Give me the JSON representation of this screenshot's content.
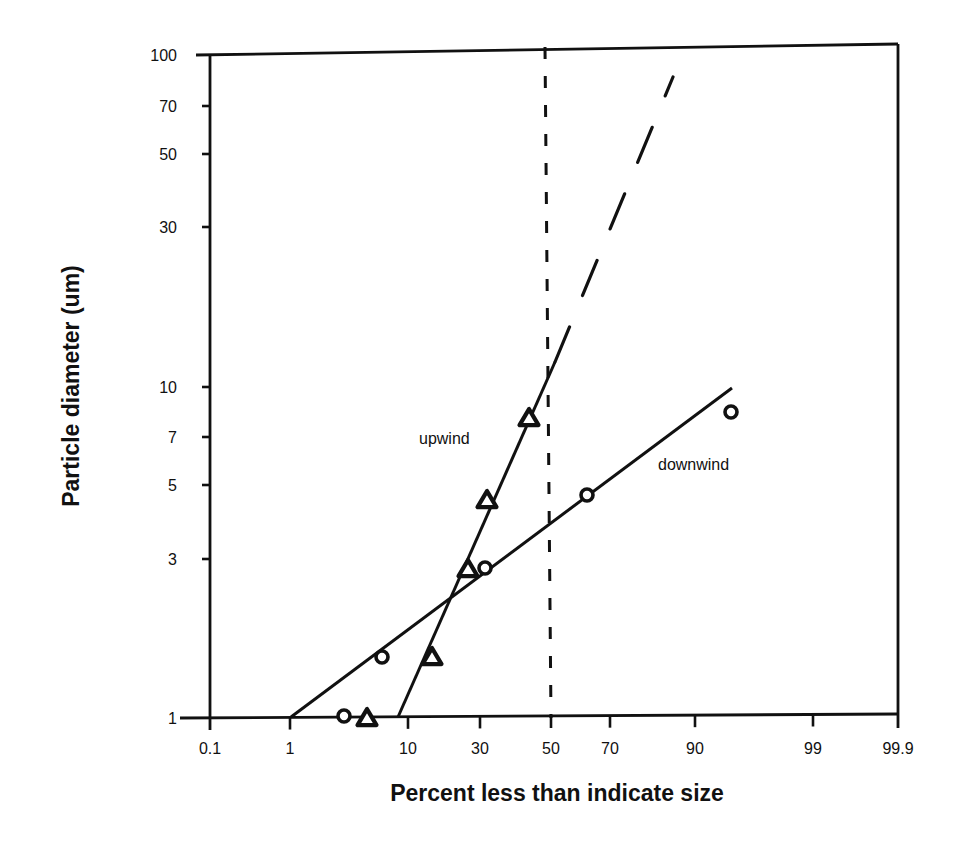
{
  "chart_data": {
    "type": "scatter",
    "title": "",
    "xlabel": "Percent less than indicate size",
    "ylabel": "Particle diameter (um)",
    "x_scale": "probability",
    "y_scale": "log",
    "xlim": [
      0.1,
      99.9
    ],
    "ylim": [
      1,
      100
    ],
    "grid": false,
    "legend": "none (inline annotations)",
    "x_ticks": [
      {
        "label": "0.1",
        "px": 210
      },
      {
        "label": "1",
        "px": 290
      },
      {
        "label": "10",
        "px": 408
      },
      {
        "label": "30",
        "px": 480
      },
      {
        "label": "50",
        "px": 551
      },
      {
        "label": "70",
        "px": 610
      },
      {
        "label": "90",
        "px": 695
      },
      {
        "label": "99",
        "px": 813
      },
      {
        "label": "99.9",
        "px": 898
      }
    ],
    "y_ticks": [
      {
        "label": "100",
        "py": 55
      },
      {
        "label": "70",
        "py": 106
      },
      {
        "label": "50",
        "py": 154
      },
      {
        "label": "30",
        "py": 227
      },
      {
        "label": "10",
        "py": 387
      },
      {
        "label": "7",
        "py": 437
      },
      {
        "label": "5",
        "py": 485
      },
      {
        "label": "3",
        "py": 559
      },
      {
        "label": "1",
        "py": 718
      }
    ],
    "series": [
      {
        "name": "upwind",
        "marker": "triangle",
        "points": [
          {
            "x": 4,
            "y": 1.0,
            "px": 367,
            "py": 719
          },
          {
            "x": 15,
            "y": 1.8,
            "px": 432,
            "py": 658
          },
          {
            "x": 24,
            "y": 2.7,
            "px": 468,
            "py": 570
          },
          {
            "x": 29,
            "y": 4.5,
            "px": 487,
            "py": 501
          },
          {
            "x": 42,
            "y": 8,
            "px": 529,
            "py": 419
          }
        ],
        "fit_line": {
          "px1": 398,
          "py1": 717,
          "px2": 555,
          "py2": 362,
          "style": "solid"
        },
        "extrapolation": {
          "px1": 555,
          "py1": 362,
          "px2": 673,
          "py2": 77,
          "style": "long-dash"
        }
      },
      {
        "name": "downwind",
        "marker": "circle",
        "points": [
          {
            "x": 3,
            "y": 1.0,
            "px": 344,
            "py": 716
          },
          {
            "x": 6,
            "y": 1.8,
            "px": 382,
            "py": 657
          },
          {
            "x": 28,
            "y": 2.8,
            "px": 485,
            "py": 568
          },
          {
            "x": 63,
            "y": 4.7,
            "px": 587,
            "py": 495
          },
          {
            "x": 95,
            "y": 8.5,
            "px": 731,
            "py": 412
          }
        ],
        "fit_line": {
          "px1": 291,
          "py1": 717,
          "px2": 732,
          "py2": 388,
          "style": "solid"
        }
      }
    ],
    "reference_lines": [
      {
        "orientation": "vertical",
        "x": 50,
        "px": 545,
        "py_top": 47,
        "px_bottom": 551,
        "py_bottom": 718,
        "style": "short-dash"
      }
    ],
    "annotations": [
      {
        "text": "upwind",
        "px": 419,
        "py": 444
      },
      {
        "text": "downwind",
        "px": 658,
        "py": 470
      }
    ],
    "frame": {
      "left": 210,
      "top": 55,
      "right": 898,
      "bottom": 718,
      "top_right_y": 44
    }
  }
}
